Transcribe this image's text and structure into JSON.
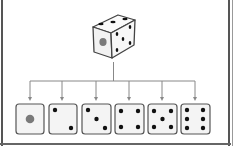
{
  "diagram": {
    "root": {
      "label": "die",
      "visible_faces": {
        "front": 1,
        "top": 3,
        "right": 5
      }
    },
    "outcomes": [
      {
        "face": 1
      },
      {
        "face": 2
      },
      {
        "face": 3
      },
      {
        "face": 4
      },
      {
        "face": 5
      },
      {
        "face": 6
      }
    ],
    "colors": {
      "pip": "#111111",
      "one_pip": "#7a7a7a",
      "connector": "#888888",
      "face_border": "#555555",
      "face_fill": "#f4f4f4"
    }
  }
}
